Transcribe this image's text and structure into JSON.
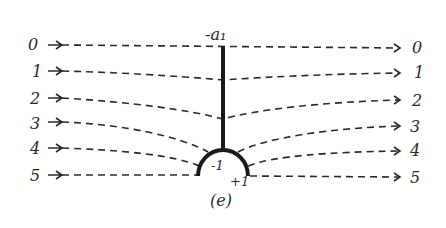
{
  "figure": {
    "caption": "(e)",
    "top_label": "-a₁",
    "arc_left_label": "-1",
    "arc_right_label": "+1"
  },
  "streamlines": [
    {
      "label_left": "0",
      "label_right": "0"
    },
    {
      "label_left": "1",
      "label_right": "1"
    },
    {
      "label_left": "2",
      "label_right": "2"
    },
    {
      "label_left": "3",
      "label_right": "3"
    },
    {
      "label_left": "4",
      "label_right": "4"
    },
    {
      "label_left": "5",
      "label_right": "5"
    }
  ],
  "colors": {
    "ink": "#2a2a2a",
    "background": "#ffffff"
  }
}
